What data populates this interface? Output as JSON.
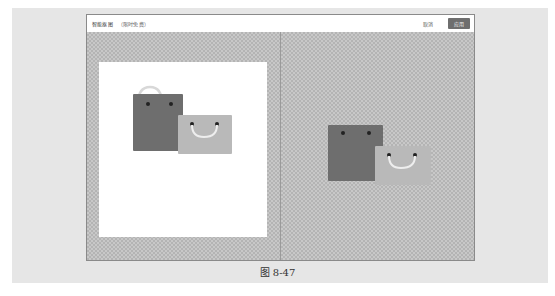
{
  "dialog": {
    "title": "智能抠图",
    "subtitle": "（限时免费）",
    "cancel_label": "取消",
    "apply_label": "应用"
  },
  "panels": {
    "left": {
      "label": "original-image",
      "background": "#ffffff"
    },
    "right": {
      "label": "cutout-result",
      "background": "transparent-checkerboard"
    }
  },
  "colors": {
    "apply_button": "#6e6e6e",
    "dark_bag": "#6e6e6e",
    "light_bag": "#b9b9b9",
    "outer_band": "#e6e6e6"
  },
  "caption": "图 8-47"
}
